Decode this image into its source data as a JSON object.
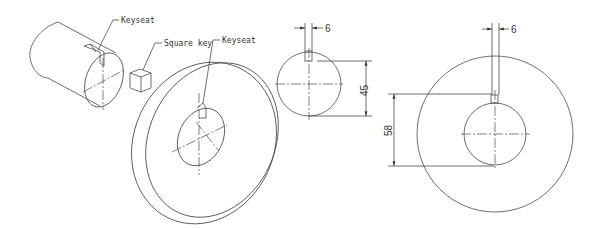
{
  "figure": {
    "type": "technical-drawing"
  },
  "labels": {
    "shaft_keyseat": "Keyseat",
    "square_key": "Square key",
    "hub_keyseat": "Keyseat"
  },
  "shaft_view": {
    "key_width_dim": "6",
    "diameter_dim": "45"
  },
  "hub_view": {
    "key_width_dim": "6",
    "depth_dim": "58"
  },
  "colors": {
    "line": "#4a4a4a",
    "background": "#ffffff"
  }
}
